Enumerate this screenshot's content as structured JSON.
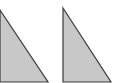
{
  "diagram": {
    "shapes": [
      {
        "type": "right-triangle",
        "points": "0,10 48,82 0,82",
        "fill": "#c8c8c8",
        "stroke": "#3a3a3a"
      },
      {
        "type": "right-triangle",
        "points": "63,8 111,82 63,82",
        "fill": "#c8c8c8",
        "stroke": "#3a3a3a"
      }
    ]
  }
}
